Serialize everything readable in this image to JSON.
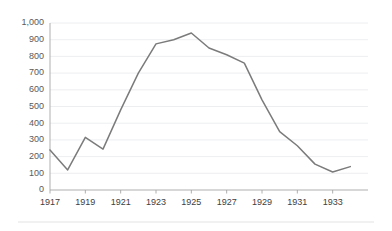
{
  "chart_data": {
    "type": "line",
    "title": "",
    "subtitle": "",
    "xlabel": "",
    "ylabel": "",
    "x": [
      1917,
      1918,
      1919,
      1920,
      1921,
      1922,
      1923,
      1924,
      1925,
      1926,
      1927,
      1928,
      1929,
      1930,
      1931,
      1932,
      1933,
      1934
    ],
    "values": [
      240,
      120,
      315,
      245,
      480,
      700,
      875,
      900,
      940,
      850,
      810,
      760,
      540,
      350,
      265,
      155,
      108,
      140
    ],
    "series": [
      {
        "name": "series-1",
        "color": "#7b7b7b",
        "values": [
          240,
          120,
          315,
          245,
          480,
          700,
          875,
          900,
          940,
          850,
          810,
          760,
          540,
          350,
          265,
          155,
          108,
          140
        ]
      }
    ],
    "xlim": [
      1917,
      1935
    ],
    "ylim": [
      0,
      1000
    ],
    "ytick_labels": [
      "0",
      "100",
      "200",
      "300",
      "400",
      "500",
      "600",
      "700",
      "800",
      "900",
      "1,000"
    ],
    "ytick_values": [
      0,
      100,
      200,
      300,
      400,
      500,
      600,
      700,
      800,
      900,
      1000
    ],
    "xtick_labels": [
      "1917",
      "1919",
      "1921",
      "1923",
      "1925",
      "1927",
      "1929",
      "1931",
      "1933"
    ],
    "xtick_values": [
      1917,
      1919,
      1921,
      1923,
      1925,
      1927,
      1929,
      1931,
      1933
    ],
    "grid": "horizontal",
    "grid_color": "#e8eaec",
    "legend": "none",
    "axis_color": "#a6a6a6",
    "annotations": []
  },
  "layout": {
    "plot_left": 50,
    "plot_right": 368,
    "plot_top": 23,
    "plot_bottom": 190,
    "footer_rule_y": 222,
    "footer_rule_left": 18,
    "footer_rule_right": 374
  }
}
